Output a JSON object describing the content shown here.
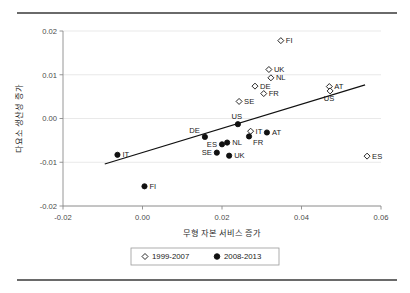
{
  "chart_data": {
    "type": "scatter",
    "title": "",
    "xlabel": "무형 자본 서비스 증가",
    "ylabel": "다요소 생산성 증가",
    "xlim": [
      -0.02,
      0.06
    ],
    "ylim": [
      -0.02,
      0.02
    ],
    "xticks": [
      "-0.02",
      "0.00",
      "0.02",
      "0.04",
      "0.06"
    ],
    "xtick_values": [
      -0.02,
      0.0,
      0.02,
      0.04,
      0.06
    ],
    "yticks": [
      "0.02",
      "0.01",
      "0.00",
      "-0.01",
      "-0.02"
    ],
    "ytick_values": [
      0.02,
      0.01,
      0.0,
      -0.01,
      -0.02
    ],
    "grid": true,
    "grid_axis": "y",
    "legend_position": "bottom",
    "series": [
      {
        "name": "1999-2007",
        "marker": "open-diamond",
        "color": "#111111",
        "points": [
          {
            "label": "FI",
            "x": 0.0348,
            "y": 0.0178,
            "label_pos": "right"
          },
          {
            "label": "UK",
            "x": 0.0318,
            "y": 0.0112,
            "label_pos": "right"
          },
          {
            "label": "NL",
            "x": 0.0323,
            "y": 0.0093,
            "label_pos": "right"
          },
          {
            "label": "DE",
            "x": 0.0283,
            "y": 0.0074,
            "label_pos": "right"
          },
          {
            "label": "FR",
            "x": 0.0305,
            "y": 0.0057,
            "label_pos": "right"
          },
          {
            "label": "AT",
            "x": 0.047,
            "y": 0.0073,
            "label_pos": "right"
          },
          {
            "label": "US",
            "x": 0.0472,
            "y": 0.0063,
            "label_pos": "below"
          },
          {
            "label": "SE",
            "x": 0.0243,
            "y": 0.0039,
            "label_pos": "right"
          },
          {
            "label": "IT",
            "x": 0.0272,
            "y": -0.0029,
            "label_pos": "right"
          },
          {
            "label": "ES",
            "x": 0.0565,
            "y": -0.0086,
            "label_pos": "right"
          }
        ]
      },
      {
        "name": "2008-2013",
        "marker": "filled-circle",
        "color": "#111111",
        "points": [
          {
            "label": "US",
            "x": 0.024,
            "y": -0.0013,
            "label_pos": "above"
          },
          {
            "label": "DE",
            "x": 0.0157,
            "y": -0.0042,
            "label_pos": "above-left"
          },
          {
            "label": "AT",
            "x": 0.0313,
            "y": -0.0032,
            "label_pos": "right"
          },
          {
            "label": "FR",
            "x": 0.0268,
            "y": -0.0041,
            "label_pos": "below-right"
          },
          {
            "label": "ES",
            "x": 0.02,
            "y": -0.0059,
            "label_pos": "left"
          },
          {
            "label": "NL",
            "x": 0.0213,
            "y": -0.0055,
            "label_pos": "right"
          },
          {
            "label": "SE",
            "x": 0.0187,
            "y": -0.0078,
            "label_pos": "left"
          },
          {
            "label": "UK",
            "x": 0.0218,
            "y": -0.0085,
            "label_pos": "right"
          },
          {
            "label": "IT",
            "x": -0.0063,
            "y": -0.0083,
            "label_pos": "right"
          },
          {
            "label": "FI",
            "x": 0.0005,
            "y": -0.0155,
            "label_pos": "right"
          }
        ]
      }
    ],
    "trendline": {
      "x_start": -0.0095,
      "y_start": -0.0104,
      "x_end": 0.056,
      "y_end": 0.0077
    }
  },
  "legend": {
    "items": [
      {
        "label": "1999-2007",
        "marker": "open-diamond"
      },
      {
        "label": "2008-2013",
        "marker": "filled-circle"
      }
    ]
  }
}
